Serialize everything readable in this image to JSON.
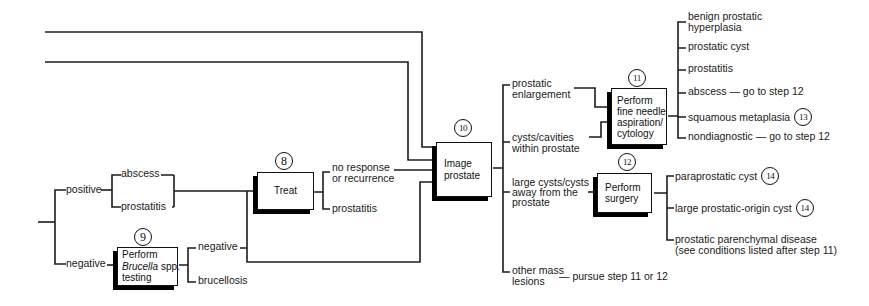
{
  "figure": {
    "culture_branches": {
      "positive": "positive",
      "negative": "negative"
    },
    "positive_findings": {
      "abscess": "abscess",
      "prostatitis": "prostatitis"
    },
    "step8": {
      "number": "8",
      "title": "Treat",
      "outcome_no_response": "no response\nor recurrence",
      "outcome_prostatitis": "prostatitis"
    },
    "step9": {
      "number": "9",
      "title_line1": "Perform",
      "title_species_italic": "Brucella",
      "title_species_rest": " spp.",
      "title_line3": "testing",
      "outcome_negative": "negative",
      "outcome_brucellosis": "brucellosis"
    },
    "step10": {
      "number": "10",
      "title": "Image\nprostate",
      "finding_enlargement": "prostatic\nenlargement",
      "finding_cysts": "cysts/cavities\nwithin prostate",
      "finding_large_cysts": "large cysts/cysts\naway from the\nprostate",
      "finding_other_mass": "other mass\nlesions",
      "other_mass_action": "— pursue step 11 or 12"
    },
    "step11": {
      "number": "11",
      "title": "Perform\nfine needle\naspiration/\ncytology",
      "results": {
        "bph": "benign prostatic\nhyperplasia",
        "prostatic_cyst": "prostatic cyst",
        "prostatitis": "prostatitis",
        "abscess": "abscess — go to step 12",
        "squamous_metaplasia": "squamous metaplasia",
        "nondiagnostic": "nondiagnostic — go to step 12"
      }
    },
    "step12": {
      "number": "12",
      "title": "Perform\nsurgery",
      "results": {
        "paraprostatic_cyst": "paraprostatic cyst",
        "large_origin_cyst": "large prostatic-origin cyst",
        "parenchymal": "prostatic parenchymal disease\n(see conditions listed after step 11)"
      }
    },
    "step13": {
      "number": "13"
    },
    "step14a": {
      "number": "14"
    },
    "step14b": {
      "number": "14"
    }
  }
}
